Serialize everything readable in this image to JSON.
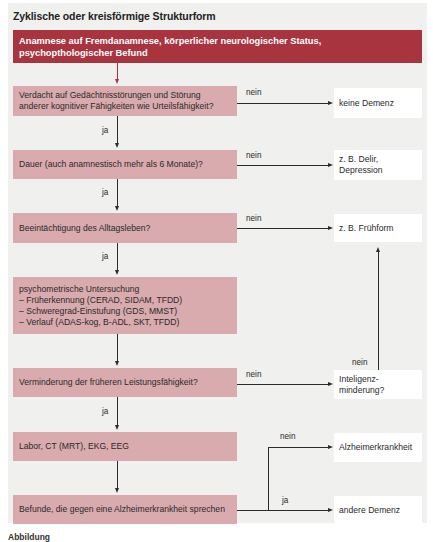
{
  "title": "Zyklische oder kreisförmige Strukturform",
  "colors": {
    "header_box": "#a8343f",
    "decision_box": "#d9aaae",
    "outcome_box": "#ffffff",
    "panel_bg": "#f0f0ee",
    "line": "#2b2b2b"
  },
  "header_box": {
    "line1": "Anamnese auf Fremdanamnese, körperlicher neurologischer Status,",
    "line2": "psychopthologischer Befund"
  },
  "steps": [
    {
      "id": "verdacht",
      "lines": [
        "Verdacht auf Gedächtnisstörungen und Störung",
        "anderer kognitiver Fähigkeiten wie Urteilsfähigkeit?"
      ],
      "no_label": "nein",
      "yes_label": "ja"
    },
    {
      "id": "dauer",
      "lines": [
        "Dauer (auch anamnestisch mehr als 6 Monate)?"
      ],
      "no_label": "nein",
      "yes_label": "ja"
    },
    {
      "id": "alltag",
      "lines": [
        "Beeintächtigung des Alltagsleben?"
      ],
      "no_label": "nein",
      "yes_label": "ja"
    },
    {
      "id": "psychometrie",
      "lines": [
        "psychometrische Untersuchung",
        "–  Früherkennung (CERAD, SIDAM, TFDD)",
        "–  Schweregrad-Einstufung (GDS, MMST)",
        "–  Verlauf (ADAS-kog, B-ADL, SKT, TFDD)"
      ]
    },
    {
      "id": "verminderung",
      "lines": [
        "Verminderung der früheren Leistungsfähigkeit?"
      ],
      "no_label": "nein",
      "yes_label": "ja"
    },
    {
      "id": "labor",
      "lines": [
        "Labor, CT (MRT), EKG, EEG"
      ]
    },
    {
      "id": "befunde",
      "lines": [
        "Befunde, die gegen eine Alzheimerkrankheit sprechen"
      ],
      "no_label": "nein",
      "yes_label": "ja"
    }
  ],
  "outcomes": {
    "keine_demenz": [
      "keine Demenz"
    ],
    "delir": [
      "z. B. Delir,",
      "Depression"
    ],
    "fruehform": [
      "z. B. Frühform"
    ],
    "intelligenz": [
      "Inteligenz-",
      "minderung?"
    ],
    "intelligenz_no_label": "nein",
    "alzheimer": [
      "Alzheimerkrankheit"
    ],
    "andere": [
      "andere Demenz"
    ]
  },
  "caption": "Abbildung"
}
